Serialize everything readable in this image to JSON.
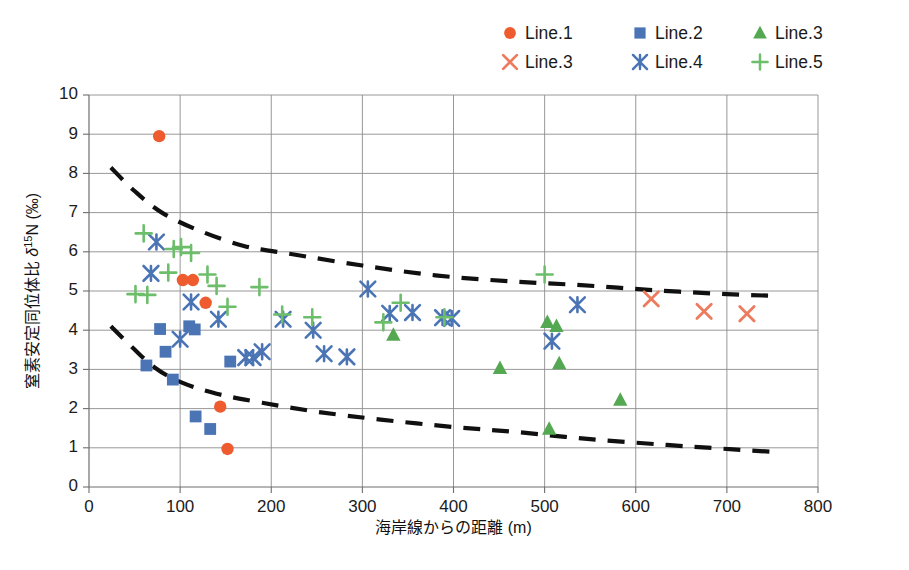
{
  "chart_data": {
    "type": "scatter",
    "title": "",
    "xlabel": "海岸線からの距離 (m)",
    "ylabel": "窒素安定同位体比 δ15N (‰)",
    "ylabel_parts": {
      "pre": "窒素安定同位体比 ",
      "delta": "δ",
      "sup": "15",
      "elem": "N (‰)"
    },
    "xlim": [
      0,
      800
    ],
    "ylim": [
      0,
      10
    ],
    "xticks": [
      0,
      100,
      200,
      300,
      400,
      500,
      600,
      700,
      800
    ],
    "yticks": [
      0,
      1,
      2,
      3,
      4,
      5,
      6,
      7,
      8,
      9,
      10
    ],
    "grid": true,
    "legend_position": "top-right",
    "series": [
      {
        "name": "Line.1",
        "marker": "circle",
        "color": "#ED5B2E",
        "points": [
          {
            "x": 77,
            "y": 8.95
          },
          {
            "x": 103,
            "y": 5.28
          },
          {
            "x": 114,
            "y": 5.28
          },
          {
            "x": 128,
            "y": 4.7
          },
          {
            "x": 144,
            "y": 2.05
          },
          {
            "x": 152,
            "y": 0.97
          }
        ]
      },
      {
        "name": "Line.2",
        "marker": "square",
        "color": "#4A74B4",
        "points": [
          {
            "x": 63,
            "y": 3.1
          },
          {
            "x": 78,
            "y": 4.03
          },
          {
            "x": 84,
            "y": 3.45
          },
          {
            "x": 92,
            "y": 2.74
          },
          {
            "x": 110,
            "y": 4.1
          },
          {
            "x": 116,
            "y": 4.02
          },
          {
            "x": 117,
            "y": 1.8
          },
          {
            "x": 133,
            "y": 1.48
          },
          {
            "x": 155,
            "y": 3.2
          }
        ]
      },
      {
        "name": "Line.3",
        "marker": "triangle",
        "color": "#54A852",
        "points": [
          {
            "x": 334,
            "y": 3.88
          },
          {
            "x": 451,
            "y": 3.03
          },
          {
            "x": 503,
            "y": 4.2
          },
          {
            "x": 505,
            "y": 1.48
          },
          {
            "x": 513,
            "y": 4.1
          },
          {
            "x": 516,
            "y": 3.15
          },
          {
            "x": 583,
            "y": 2.22
          }
        ]
      },
      {
        "name": "Line.3",
        "marker": "x",
        "color": "#ED7B5E",
        "points": [
          {
            "x": 617,
            "y": 4.8
          },
          {
            "x": 675,
            "y": 4.48
          },
          {
            "x": 722,
            "y": 4.42
          }
        ]
      },
      {
        "name": "Line.4",
        "marker": "star",
        "color": "#4A74B4",
        "points": [
          {
            "x": 74,
            "y": 6.25
          },
          {
            "x": 68,
            "y": 5.45
          },
          {
            "x": 100,
            "y": 3.77
          },
          {
            "x": 112,
            "y": 4.72
          },
          {
            "x": 142,
            "y": 4.28
          },
          {
            "x": 172,
            "y": 3.3
          },
          {
            "x": 180,
            "y": 3.3
          },
          {
            "x": 190,
            "y": 3.45
          },
          {
            "x": 213,
            "y": 4.28
          },
          {
            "x": 246,
            "y": 4.0
          },
          {
            "x": 258,
            "y": 3.4
          },
          {
            "x": 283,
            "y": 3.32
          },
          {
            "x": 306,
            "y": 5.05
          },
          {
            "x": 330,
            "y": 4.43
          },
          {
            "x": 355,
            "y": 4.45
          },
          {
            "x": 388,
            "y": 4.32
          },
          {
            "x": 398,
            "y": 4.3
          },
          {
            "x": 508,
            "y": 3.72
          },
          {
            "x": 536,
            "y": 4.65
          }
        ]
      },
      {
        "name": "Line.5",
        "marker": "plus",
        "color": "#6DBE6B",
        "points": [
          {
            "x": 60,
            "y": 6.47
          },
          {
            "x": 51,
            "y": 4.92
          },
          {
            "x": 64,
            "y": 4.9
          },
          {
            "x": 93,
            "y": 6.07
          },
          {
            "x": 101,
            "y": 6.12
          },
          {
            "x": 112,
            "y": 5.97
          },
          {
            "x": 87,
            "y": 5.47
          },
          {
            "x": 130,
            "y": 5.42
          },
          {
            "x": 152,
            "y": 4.6
          },
          {
            "x": 140,
            "y": 5.13
          },
          {
            "x": 187,
            "y": 5.1
          },
          {
            "x": 212,
            "y": 4.4
          },
          {
            "x": 245,
            "y": 4.33
          },
          {
            "x": 342,
            "y": 4.7
          },
          {
            "x": 323,
            "y": 4.2
          },
          {
            "x": 390,
            "y": 4.33
          },
          {
            "x": 500,
            "y": 5.42
          }
        ]
      }
    ],
    "envelopes": [
      {
        "name": "upper-envelope",
        "style": "dashed",
        "color": "#101010",
        "points": [
          {
            "x": 24,
            "y": 8.15
          },
          {
            "x": 50,
            "y": 7.55
          },
          {
            "x": 80,
            "y": 7.0
          },
          {
            "x": 120,
            "y": 6.55
          },
          {
            "x": 170,
            "y": 6.15
          },
          {
            "x": 220,
            "y": 5.95
          },
          {
            "x": 300,
            "y": 5.65
          },
          {
            "x": 380,
            "y": 5.4
          },
          {
            "x": 460,
            "y": 5.25
          },
          {
            "x": 540,
            "y": 5.15
          },
          {
            "x": 620,
            "y": 5.02
          },
          {
            "x": 700,
            "y": 4.92
          },
          {
            "x": 748,
            "y": 4.88
          }
        ]
      },
      {
        "name": "lower-envelope",
        "style": "dashed",
        "color": "#101010",
        "points": [
          {
            "x": 24,
            "y": 4.1
          },
          {
            "x": 48,
            "y": 3.55
          },
          {
            "x": 72,
            "y": 3.05
          },
          {
            "x": 100,
            "y": 2.68
          },
          {
            "x": 140,
            "y": 2.38
          },
          {
            "x": 190,
            "y": 2.15
          },
          {
            "x": 250,
            "y": 1.92
          },
          {
            "x": 320,
            "y": 1.72
          },
          {
            "x": 400,
            "y": 1.53
          },
          {
            "x": 470,
            "y": 1.4
          },
          {
            "x": 550,
            "y": 1.22
          },
          {
            "x": 630,
            "y": 1.08
          },
          {
            "x": 700,
            "y": 0.97
          },
          {
            "x": 748,
            "y": 0.9
          }
        ]
      }
    ],
    "legend": [
      {
        "label": "Line.1",
        "marker": "circle",
        "color": "#ED5B2E"
      },
      {
        "label": "Line.2",
        "marker": "square",
        "color": "#4A74B4"
      },
      {
        "label": "Line.3",
        "marker": "triangle",
        "color": "#54A852"
      },
      {
        "label": "Line.3",
        "marker": "x",
        "color": "#ED7B5E"
      },
      {
        "label": "Line.4",
        "marker": "star",
        "color": "#4A74B4"
      },
      {
        "label": "Line.5",
        "marker": "plus",
        "color": "#6DBE6B"
      }
    ]
  }
}
